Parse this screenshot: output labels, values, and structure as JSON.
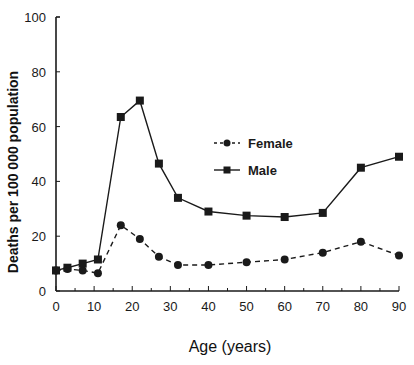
{
  "chart_data": {
    "type": "line",
    "title": "",
    "xlabel": "Age (years)",
    "ylabel": "Deaths per 100 000 population",
    "xlim": [
      0,
      90
    ],
    "ylim": [
      0,
      100
    ],
    "x_ticks": [
      0,
      10,
      20,
      30,
      40,
      50,
      60,
      70,
      80,
      90
    ],
    "y_ticks": [
      0,
      20,
      40,
      60,
      80,
      100
    ],
    "grid": false,
    "legend_position": "center-right (inside plot)",
    "x": [
      0,
      3,
      7,
      11,
      17,
      22,
      27,
      32,
      40,
      50,
      60,
      70,
      80,
      90
    ],
    "series": [
      {
        "name": "Female",
        "line_style": "dashed",
        "marker": "circle",
        "values": [
          7.5,
          8,
          7.5,
          6.5,
          24,
          19,
          12.5,
          9.5,
          9.5,
          10.5,
          11.5,
          14,
          18,
          13
        ]
      },
      {
        "name": "Male",
        "line_style": "solid",
        "marker": "square",
        "values": [
          7.5,
          8.5,
          10,
          11.5,
          63.5,
          69.5,
          46.5,
          34,
          29,
          27.5,
          27,
          28.5,
          45,
          49
        ]
      }
    ]
  },
  "colors": {
    "background": "#ffffff",
    "ink": "#1a1a1a"
  }
}
